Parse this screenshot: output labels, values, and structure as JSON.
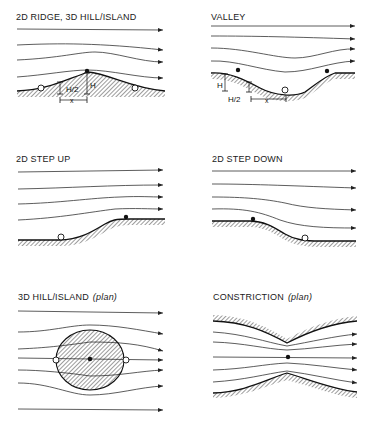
{
  "figure": {
    "legend_markers": {
      "filled_dot": "speed-up point",
      "open_circle": "slow-down point"
    },
    "panels": [
      {
        "id": "ridge",
        "title": "2D RIDGE, 3D HILL/ISLAND",
        "subtitle": "",
        "labels": {
          "height": "H",
          "half_height": "H/2",
          "distance": "x"
        }
      },
      {
        "id": "valley",
        "title": "VALLEY",
        "subtitle": "",
        "labels": {
          "height": "H",
          "half_height": "H/2",
          "distance": "x"
        }
      },
      {
        "id": "step-up",
        "title": "2D STEP UP",
        "subtitle": ""
      },
      {
        "id": "step-down",
        "title": "2D STEP DOWN",
        "subtitle": ""
      },
      {
        "id": "hill-plan",
        "title": "3D HILL/ISLAND",
        "subtitle": "(plan)"
      },
      {
        "id": "constriction",
        "title": "CONSTRICTION",
        "subtitle": "(plan)"
      }
    ]
  }
}
